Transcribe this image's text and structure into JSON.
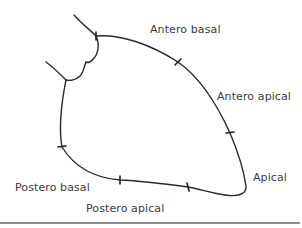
{
  "diagram": {
    "stroke_color": "#2a2a2a",
    "label_color": "#3c3c3c",
    "rule_color": "#8e8e8e",
    "labels": {
      "antero_basal": "Antero basal",
      "antero_apical": "Antero apical",
      "apical": "Apical",
      "postero_basal": "Postero basal",
      "postero_apical": "Postero apical"
    },
    "segment_markers": [
      {
        "name": "aortic-valve-boundary",
        "x": 96,
        "y": 36
      },
      {
        "name": "antero-basal-apical-boundary",
        "x": 178,
        "y": 62
      },
      {
        "name": "antero-apical-apical-boundary",
        "x": 230,
        "y": 133
      },
      {
        "name": "apical-postero-apical-boundary",
        "x": 188,
        "y": 187
      },
      {
        "name": "postero-apical-basal-boundary",
        "x": 120,
        "y": 180
      },
      {
        "name": "postero-basal-mitral-boundary",
        "x": 62,
        "y": 147
      }
    ]
  }
}
